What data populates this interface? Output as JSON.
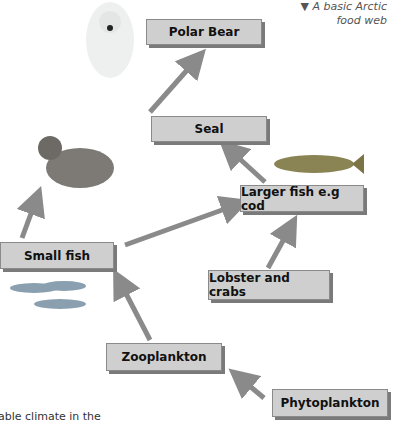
{
  "caption": {
    "marker": "▼",
    "line1": "A basic Arctic",
    "line2": "food web"
  },
  "nodes": {
    "polar_bear": "Polar Bear",
    "seal": "Seal",
    "larger_fish": "Larger fish e.g cod",
    "small_fish": "Small fish",
    "lobster": "Lobster and crabs",
    "zooplankton": "Zooplankton",
    "phytoplankton": "Phytoplankton"
  },
  "footer_text": "able climate in the",
  "colors": {
    "arrow": "#8a8a8a",
    "box": "#cfcfcf"
  }
}
